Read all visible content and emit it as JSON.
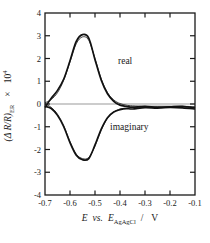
{
  "figure": {
    "background": "#ffffff",
    "frame_color": "#1a1a1a",
    "curve_color": "#111111",
    "zero_line_color": "#999999"
  },
  "axes": {
    "x": {
      "tick_labels": [
        "-0.7",
        "-0.6",
        "-0.5",
        "-0.4",
        "-0.3",
        "-0.2",
        "-0.1"
      ],
      "title_parts": {
        "e1": "E",
        "vs": "vs.",
        "e2": "E",
        "sub": "AgAgCl",
        "slash": "/",
        "unit": "V"
      }
    },
    "y": {
      "tick_labels": [
        "4",
        "3",
        "2",
        "1",
        "0",
        "-1",
        "-2",
        "-3",
        "-4"
      ],
      "title_parts": {
        "main": "(Δ R/R)",
        "sub": "ER",
        "times": "×",
        "pow_base": "10",
        "pow_exp": "4"
      }
    }
  },
  "annotations": {
    "real_label": "real",
    "imaginary_label": "imaginary"
  },
  "chart_data": {
    "type": "line",
    "title": "",
    "xlabel": "E vs. E_AgAgCl / V",
    "ylabel": "(ΔR/R)_ER × 10^4",
    "xlim": [
      -0.7,
      -0.1
    ],
    "ylim": [
      -4,
      4
    ],
    "grid": false,
    "legend": "none (inline annotations: real, imaginary)",
    "x": [
      -0.7,
      -0.675,
      -0.65,
      -0.625,
      -0.6,
      -0.575,
      -0.55,
      -0.525,
      -0.5,
      -0.475,
      -0.45,
      -0.425,
      -0.4,
      -0.375,
      -0.35,
      -0.3,
      -0.25,
      -0.2,
      -0.15,
      -0.1
    ],
    "series": [
      {
        "name": "real experimental",
        "values": [
          -0.15,
          0.25,
          0.6,
          1.1,
          1.9,
          2.75,
          3.05,
          2.9,
          1.95,
          1.05,
          0.45,
          0.12,
          -0.05,
          -0.1,
          -0.14,
          -0.1,
          -0.15,
          -0.12,
          -0.1,
          -0.18
        ]
      },
      {
        "name": "real fit",
        "values": [
          0.05,
          0.2,
          0.5,
          1.05,
          1.85,
          2.65,
          2.95,
          2.8,
          2.0,
          1.1,
          0.5,
          0.18,
          0.02,
          -0.05,
          -0.08,
          -0.1,
          -0.1,
          -0.1,
          -0.1,
          -0.12
        ]
      },
      {
        "name": "imaginary experimental",
        "values": [
          -0.1,
          -0.2,
          -0.5,
          -1.0,
          -1.7,
          -2.25,
          -2.45,
          -2.4,
          -1.8,
          -1.1,
          -0.6,
          -0.35,
          -0.25,
          -0.2,
          -0.22,
          -0.16,
          -0.18,
          -0.15,
          -0.17,
          -0.22
        ]
      },
      {
        "name": "imaginary fit",
        "values": [
          0.0,
          -0.15,
          -0.45,
          -0.95,
          -1.65,
          -2.2,
          -2.4,
          -2.35,
          -1.85,
          -1.15,
          -0.62,
          -0.35,
          -0.22,
          -0.18,
          -0.16,
          -0.15,
          -0.14,
          -0.14,
          -0.14,
          -0.16
        ]
      }
    ]
  }
}
